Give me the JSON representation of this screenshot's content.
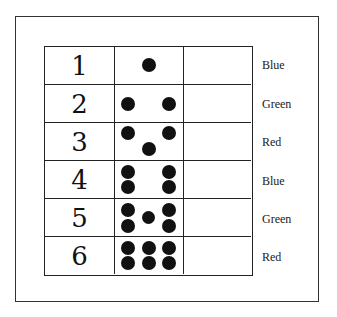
{
  "rows": [
    {
      "number": "1",
      "dots": 1,
      "color": "Blue"
    },
    {
      "number": "2",
      "dots": 2,
      "color": "Green"
    },
    {
      "number": "3",
      "dots": 3,
      "color": "Red"
    },
    {
      "number": "4",
      "dots": 4,
      "color": "Blue"
    },
    {
      "number": "5",
      "dots": 5,
      "color": "Green"
    },
    {
      "number": "6",
      "dots": 6,
      "color": "Red"
    }
  ],
  "dot_color": "#111111"
}
